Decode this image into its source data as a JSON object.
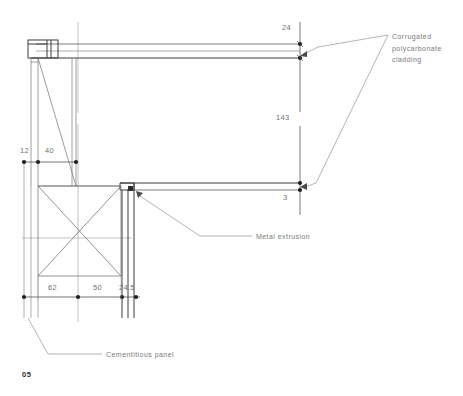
{
  "sheet": {
    "number": "05",
    "background_color": "#ffffff",
    "line_color": "#4a4a4a",
    "thin_line_color": "#8d8d8d",
    "text_color": "#6e6e6e"
  },
  "dimensions": [
    {
      "id": "dim-24",
      "value": "24",
      "x": 282,
      "y": 23,
      "orientation": "horizontal"
    },
    {
      "id": "dim-143",
      "value": "143",
      "x": 276,
      "y": 118,
      "orientation": "vertical"
    },
    {
      "id": "dim-3",
      "value": "3",
      "x": 283,
      "y": 196,
      "orientation": "horizontal"
    },
    {
      "id": "dim-12",
      "value": "12",
      "x": 21,
      "y": 150,
      "orientation": "horizontal"
    },
    {
      "id": "dim-40",
      "value": "40",
      "x": 45,
      "y": 150,
      "orientation": "horizontal"
    },
    {
      "id": "dim-62",
      "value": "62",
      "x": 48,
      "y": 284,
      "orientation": "horizontal"
    },
    {
      "id": "dim-50",
      "value": "50",
      "x": 93,
      "y": 284,
      "orientation": "horizontal"
    },
    {
      "id": "dim-24-5",
      "value": "24.5",
      "x": 119,
      "y": 284,
      "orientation": "horizontal"
    }
  ],
  "annotations": [
    {
      "id": "annotation-cladding",
      "text": "Corrugated\npolycarbonate\ncladding",
      "x": 392,
      "y": 31
    },
    {
      "id": "annotation-metal-extrusion",
      "text": "Metal extrusion",
      "x": 256,
      "y": 232
    },
    {
      "id": "annotation-cementitious-panel",
      "text": "Cementitious panel",
      "x": 106,
      "y": 350
    }
  ]
}
